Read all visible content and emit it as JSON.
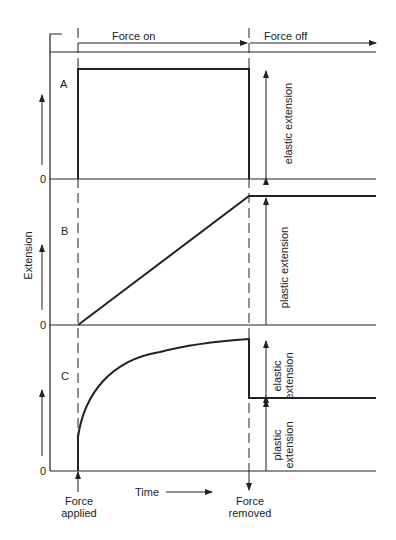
{
  "header": {
    "force_on": "Force on",
    "force_off": "Force off"
  },
  "y_axis": {
    "label": "Extension",
    "zero": "0"
  },
  "panels": [
    {
      "id": "A",
      "label": "A",
      "annotation": "elastic extension"
    },
    {
      "id": "B",
      "label": "B",
      "annotation": "plastic extension"
    },
    {
      "id": "C",
      "label": "C",
      "annotations": {
        "elastic_line1": "elastic",
        "elastic_line2": "extension",
        "plastic_line1": "plastic",
        "plastic_line2": "extension"
      }
    }
  ],
  "x_axis": {
    "label": "Time",
    "force_applied_line1": "Force",
    "force_applied_line2": "applied",
    "force_removed_line1": "Force",
    "force_removed_line2": "removed"
  },
  "colors": {
    "ink": "#222222",
    "background": "#ffffff"
  }
}
